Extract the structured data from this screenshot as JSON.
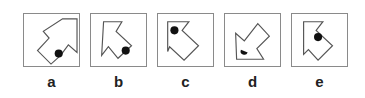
{
  "question": {
    "options": [
      {
        "id": "a",
        "label": "a",
        "left": 23,
        "arrow": "40,5 55,5 55,40 46,32 38,43 28,52 14,38 26,25 20,18",
        "dot": {
          "cx": 36,
          "cy": 41,
          "r": 4.2
        }
      },
      {
        "id": "b",
        "label": "b",
        "left": 90,
        "arrow": "13,8 32,8 26,18 42,33 28,46 18,34 11,43",
        "dot": {
          "cx": 36,
          "cy": 38,
          "r": 4.2
        }
      },
      {
        "id": "c",
        "label": "c",
        "left": 157,
        "arrow": "10,8 32,8 25,17 42,33 27,48 12,34 10,39",
        "dot": {
          "cx": 17,
          "cy": 17,
          "r": 4.2
        }
      },
      {
        "id": "d",
        "label": "d",
        "left": 224,
        "arrow": "11,20 20,28 34,10 46,23 33,36 40,47 12,47",
        "dot": {
          "cx": 20,
          "cy": 38,
          "r": 3.5,
          "half": true
        }
      },
      {
        "id": "e",
        "label": "e",
        "left": 291,
        "arrow": "12,8 32,8 25,17 42,33 27,48 17,37 12,42",
        "dot": {
          "cx": 27,
          "cy": 24,
          "r": 4.2
        }
      }
    ]
  }
}
